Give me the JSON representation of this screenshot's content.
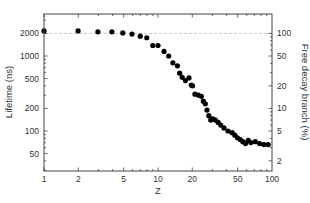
{
  "chart_data": {
    "type": "scatter",
    "title": "",
    "xlabel": "Z",
    "ylabel": "Lifetime (ns)",
    "ylabel_right": "Free decay branch (%)",
    "xscale": "log",
    "yscale": "log",
    "xlim": [
      1,
      100
    ],
    "ylim": [
      29,
      3600
    ],
    "ylim_right_percent": [
      1.45,
      180
    ],
    "x_ticks": [
      1,
      2,
      5,
      10,
      20,
      50,
      100
    ],
    "x_tick_labels": [
      "1",
      "2",
      "5",
      "10",
      "20",
      "50",
      "100"
    ],
    "y_ticks": [
      50,
      100,
      200,
      500,
      1000,
      2000
    ],
    "y_tick_labels": [
      "50",
      "100",
      "200",
      "500",
      "1000",
      "2000"
    ],
    "y_right_ticks": [
      2,
      5,
      10,
      20,
      50,
      100
    ],
    "y_right_tick_labels": [
      "2",
      "5",
      "10",
      "20",
      "50",
      "100"
    ],
    "reference_line": {
      "y": 2000,
      "style": "dashed",
      "color": "#bbbbbb",
      "label_right": "100"
    },
    "grid": false,
    "legend": null,
    "marker_color": "#000000",
    "series": [
      {
        "name": "Lifetime",
        "x": [
          1.0,
          1.99,
          2.97,
          3.94,
          4.91,
          5.91,
          6.99,
          7.97,
          9.0,
          10.0,
          11.3,
          12.4,
          13.5,
          14.8,
          15.5,
          16.3,
          17.4,
          18.7,
          19.6,
          20.1,
          21.1,
          22.6,
          24.0,
          25.0,
          26.0,
          26.9,
          27.9,
          29.0,
          30.2,
          31.9,
          33.7,
          35.5,
          37.9,
          41.1,
          44.7,
          47.2,
          49.8,
          52.6,
          55.5,
          58.5,
          61.9,
          65.2,
          71.5,
          77.9,
          84.9,
          92.6
        ],
        "y": [
          2160,
          2160,
          2100,
          2100,
          2030,
          1960,
          1840,
          1750,
          1380,
          1380,
          1150,
          1000,
          810,
          740,
          590,
          520,
          470,
          510,
          410,
          400,
          310,
          300,
          290,
          250,
          230,
          190,
          160,
          140,
          145,
          140,
          130,
          120,
          110,
          100,
          95,
          88,
          81,
          77,
          72,
          68,
          75,
          70,
          72,
          68,
          66,
          66
        ]
      }
    ]
  }
}
